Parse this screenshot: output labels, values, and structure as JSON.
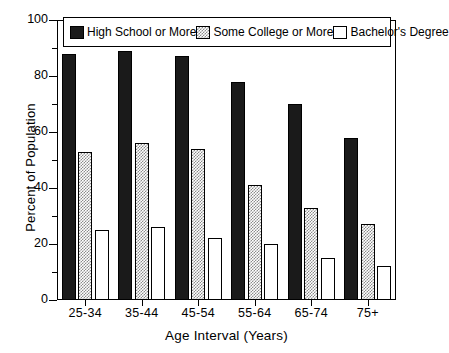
{
  "chart_data": {
    "type": "bar",
    "title": "",
    "xlabel": "Age Interval (Years)",
    "ylabel": "Percent of Population",
    "categories": [
      "25-34",
      "35-44",
      "45-54",
      "55-64",
      "65-74",
      "75+"
    ],
    "series": [
      {
        "name": "High School or More",
        "values": [
          88,
          89,
          87,
          78,
          70,
          58
        ]
      },
      {
        "name": "Some College or More",
        "values": [
          53,
          56,
          54,
          41,
          33,
          27
        ]
      },
      {
        "name": "Bachelor's Degree",
        "values": [
          25,
          26,
          22,
          20,
          15,
          12
        ]
      }
    ],
    "ylim": [
      0,
      100
    ],
    "yticks": [
      0,
      20,
      40,
      60,
      80,
      100
    ],
    "yticks_minor": [
      10,
      30,
      50,
      70,
      90
    ],
    "ytick_labels": [
      "0",
      "20",
      "40",
      "60",
      "80",
      "100"
    ],
    "grid": false,
    "legend_position": "top-inside",
    "colors": {
      "series_0": "#1a1a1a",
      "series_1": "#8c8c8c",
      "series_2": "#ffffff",
      "axis": "#000000",
      "background": "#ffffff"
    }
  },
  "legend": {
    "items": [
      {
        "label": "High School or More"
      },
      {
        "label": "Some College or More"
      },
      {
        "label": "Bachelor's Degree"
      }
    ]
  }
}
